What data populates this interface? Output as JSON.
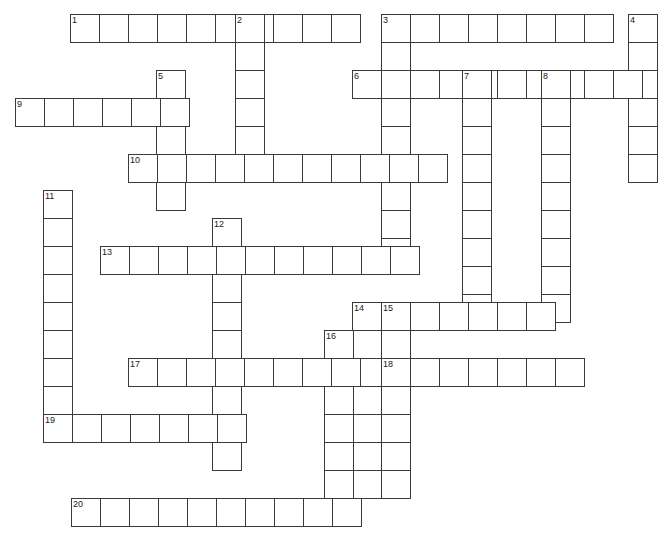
{
  "puzzle": {
    "title": "Crossword Puzzle Grid",
    "cell_size": 29,
    "cell_height": 28,
    "grid_color": "#3a3a3a",
    "cell_fill": "#ffffff",
    "background": "#ffffff",
    "number_color": "#1a1a1a",
    "total_entries": 20,
    "across_count": 11,
    "down_count": 9
  },
  "entries": [
    {
      "number": "1",
      "direction": "across",
      "x": 70,
      "y": 14,
      "length": 10
    },
    {
      "number": "2",
      "direction": "down",
      "x": 235,
      "y": 14,
      "length": 6
    },
    {
      "number": "3",
      "direction": "across",
      "x": 381,
      "y": 14,
      "length": 8
    },
    {
      "number": "3",
      "direction": "down",
      "x": 381,
      "y": 14,
      "length": 9
    },
    {
      "number": "4",
      "direction": "down",
      "x": 628,
      "y": 14,
      "length": 6
    },
    {
      "number": "5",
      "direction": "down",
      "x": 156,
      "y": 70,
      "length": 5
    },
    {
      "number": "6",
      "direction": "across",
      "x": 352,
      "y": 70,
      "length": 10
    },
    {
      "number": "7",
      "direction": "down",
      "x": 462,
      "y": 70,
      "length": 9
    },
    {
      "number": "8",
      "direction": "down",
      "x": 541,
      "y": 70,
      "length": 9
    },
    {
      "number": "9",
      "direction": "across",
      "x": 15,
      "y": 98,
      "length": 6
    },
    {
      "number": "10",
      "direction": "across",
      "x": 128,
      "y": 154,
      "length": 11
    },
    {
      "number": "11",
      "direction": "down",
      "x": 43,
      "y": 190,
      "length": 9
    },
    {
      "number": "12",
      "direction": "down",
      "x": 212,
      "y": 218,
      "length": 9
    },
    {
      "number": "13",
      "direction": "across",
      "x": 100,
      "y": 246,
      "length": 11
    },
    {
      "number": "14",
      "direction": "down",
      "x": 352,
      "y": 302,
      "length": 7
    },
    {
      "number": "15",
      "direction": "across",
      "x": 381,
      "y": 302,
      "length": 6
    },
    {
      "number": "15",
      "direction": "down",
      "x": 381,
      "y": 302,
      "length": 7
    },
    {
      "number": "16",
      "direction": "down",
      "x": 324,
      "y": 330,
      "length": 7
    },
    {
      "number": "17",
      "direction": "across",
      "x": 128,
      "y": 358,
      "length": 8
    },
    {
      "number": "18",
      "direction": "across",
      "x": 381,
      "y": 358,
      "length": 7
    },
    {
      "number": "19",
      "direction": "across",
      "x": 43,
      "y": 414,
      "length": 7
    },
    {
      "number": "20",
      "direction": "across",
      "x": 71,
      "y": 498,
      "length": 10
    }
  ],
  "numbers": [
    {
      "label": "1",
      "x": 70,
      "y": 14
    },
    {
      "label": "2",
      "x": 235,
      "y": 14
    },
    {
      "label": "3",
      "x": 381,
      "y": 14
    },
    {
      "label": "4",
      "x": 628,
      "y": 14
    },
    {
      "label": "5",
      "x": 156,
      "y": 70
    },
    {
      "label": "6",
      "x": 352,
      "y": 70
    },
    {
      "label": "7",
      "x": 462,
      "y": 70
    },
    {
      "label": "8",
      "x": 541,
      "y": 70
    },
    {
      "label": "9",
      "x": 15,
      "y": 98
    },
    {
      "label": "10",
      "x": 128,
      "y": 154
    },
    {
      "label": "11",
      "x": 43,
      "y": 190
    },
    {
      "label": "12",
      "x": 212,
      "y": 218
    },
    {
      "label": "13",
      "x": 100,
      "y": 246
    },
    {
      "label": "14",
      "x": 352,
      "y": 302
    },
    {
      "label": "15",
      "x": 381,
      "y": 302
    },
    {
      "label": "16",
      "x": 324,
      "y": 330
    },
    {
      "label": "17",
      "x": 128,
      "y": 358
    },
    {
      "label": "18",
      "x": 381,
      "y": 358
    },
    {
      "label": "19",
      "x": 43,
      "y": 414
    },
    {
      "label": "20",
      "x": 71,
      "y": 498
    }
  ]
}
